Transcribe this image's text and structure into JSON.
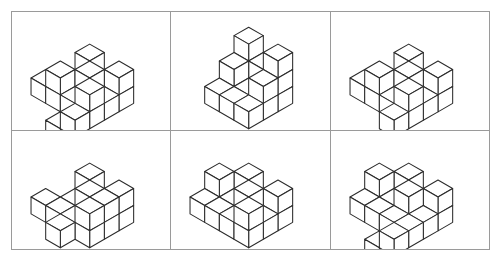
{
  "page": {
    "background_color": "#ffffff",
    "line_color": "#2b2b2b",
    "grid_border_color": "#9a9a9a",
    "width": 500,
    "height": 262,
    "rows": 2,
    "columns": 3
  },
  "figures": [
    {
      "id": "figure-1",
      "position": "row-1-col-1",
      "label": "",
      "description": "Isometric assembly: large notched block with three detached small cubes at left, right and front",
      "cube_unit": 17,
      "origin": {
        "x": 78,
        "y": 66
      },
      "cubes": [
        {
          "x": 0,
          "y": 0,
          "z": 0
        },
        {
          "x": 1,
          "y": 0,
          "z": 0
        },
        {
          "x": 2,
          "y": 0,
          "z": 0
        },
        {
          "x": 0,
          "y": 1,
          "z": 0
        },
        {
          "x": 2,
          "y": 1,
          "z": 0
        },
        {
          "x": 0,
          "y": 2,
          "z": 0
        },
        {
          "x": 1,
          "y": 2,
          "z": 0
        },
        {
          "x": 2,
          "y": 2,
          "z": 0
        },
        {
          "x": 0,
          "y": 0,
          "z": 1
        },
        {
          "x": 2,
          "y": 0,
          "z": 1
        },
        {
          "x": 0,
          "y": 2,
          "z": 1
        },
        {
          "x": 2,
          "y": 2,
          "z": 1
        },
        {
          "x": 1,
          "y": 1,
          "z": 1
        }
      ],
      "detached_cubes": [
        {
          "x": -1,
          "y": 2,
          "z": 0
        },
        {
          "x": 2,
          "y": 3,
          "z": 0
        },
        {
          "x": 1,
          "y": 3,
          "z": -1
        }
      ]
    },
    {
      "id": "figure-2",
      "position": "row-1-col-2",
      "label": "",
      "description": "Solid rectangular block with stepped staircase on the front-right and a square notch on the top",
      "cube_unit": 17,
      "origin": {
        "x": 78,
        "y": 66
      },
      "cubes": [
        {
          "x": 0,
          "y": 0,
          "z": 0
        },
        {
          "x": 1,
          "y": 0,
          "z": 0
        },
        {
          "x": 2,
          "y": 0,
          "z": 0
        },
        {
          "x": 0,
          "y": 1,
          "z": 0
        },
        {
          "x": 1,
          "y": 1,
          "z": 0
        },
        {
          "x": 2,
          "y": 1,
          "z": 0
        },
        {
          "x": 0,
          "y": 2,
          "z": 0
        },
        {
          "x": 1,
          "y": 2,
          "z": 0
        },
        {
          "x": 2,
          "y": 2,
          "z": 0
        },
        {
          "x": 0,
          "y": 0,
          "z": 1
        },
        {
          "x": 1,
          "y": 0,
          "z": 1
        },
        {
          "x": 2,
          "y": 0,
          "z": 1
        },
        {
          "x": 0,
          "y": 1,
          "z": 1
        },
        {
          "x": 2,
          "y": 1,
          "z": 1
        },
        {
          "x": 0,
          "y": 0,
          "z": 2
        },
        {
          "x": 2,
          "y": 0,
          "z": 2
        }
      ],
      "detached_cubes": []
    },
    {
      "id": "figure-3",
      "position": "row-1-col-3",
      "label": "",
      "description": "Isometric notched block with two small cubes attached at lower left and lower right",
      "cube_unit": 17,
      "origin": {
        "x": 78,
        "y": 66
      },
      "cubes": [
        {
          "x": 0,
          "y": 0,
          "z": 0
        },
        {
          "x": 1,
          "y": 0,
          "z": 0
        },
        {
          "x": 2,
          "y": 0,
          "z": 0
        },
        {
          "x": 0,
          "y": 1,
          "z": 0
        },
        {
          "x": 1,
          "y": 1,
          "z": 0
        },
        {
          "x": 2,
          "y": 1,
          "z": 0
        },
        {
          "x": 0,
          "y": 2,
          "z": 0
        },
        {
          "x": 1,
          "y": 2,
          "z": 0
        },
        {
          "x": 2,
          "y": 2,
          "z": 0
        },
        {
          "x": 0,
          "y": 0,
          "z": 1
        },
        {
          "x": 2,
          "y": 0,
          "z": 1
        },
        {
          "x": 0,
          "y": 2,
          "z": 1
        },
        {
          "x": 2,
          "y": 2,
          "z": 1
        },
        {
          "x": 1,
          "y": 1,
          "z": 1
        }
      ],
      "detached_cubes": [
        {
          "x": -1,
          "y": 2,
          "z": 0
        },
        {
          "x": 2,
          "y": 3,
          "z": 0
        }
      ]
    },
    {
      "id": "figure-4",
      "position": "row-2-col-1",
      "label": "",
      "description": "Notched isometric block with one detached cube at left and one cube on the front lower step",
      "cube_unit": 17,
      "origin": {
        "x": 78,
        "y": 66
      },
      "cubes": [
        {
          "x": 0,
          "y": 0,
          "z": 0
        },
        {
          "x": 1,
          "y": 0,
          "z": 0
        },
        {
          "x": 2,
          "y": 0,
          "z": 0
        },
        {
          "x": 0,
          "y": 1,
          "z": 0
        },
        {
          "x": 1,
          "y": 1,
          "z": 0
        },
        {
          "x": 2,
          "y": 1,
          "z": 0
        },
        {
          "x": 0,
          "y": 2,
          "z": 0
        },
        {
          "x": 1,
          "y": 2,
          "z": 0
        },
        {
          "x": 2,
          "y": 2,
          "z": 0
        },
        {
          "x": 0,
          "y": 0,
          "z": 1
        },
        {
          "x": 2,
          "y": 0,
          "z": 1
        },
        {
          "x": 2,
          "y": 1,
          "z": 1
        },
        {
          "x": 2,
          "y": 2,
          "z": 1
        },
        {
          "x": 1,
          "y": 1,
          "z": 1
        }
      ],
      "detached_cubes": [
        {
          "x": -1,
          "y": 2,
          "z": 0
        },
        {
          "x": 1,
          "y": 3,
          "z": 0
        }
      ]
    },
    {
      "id": "figure-5",
      "position": "row-2-col-2",
      "label": "",
      "description": "Notched block with a cube protruding at upper left and a detached cube below it",
      "cube_unit": 17,
      "origin": {
        "x": 78,
        "y": 66
      },
      "cubes": [
        {
          "x": 0,
          "y": 0,
          "z": 0
        },
        {
          "x": 1,
          "y": 0,
          "z": 0
        },
        {
          "x": 2,
          "y": 0,
          "z": 0
        },
        {
          "x": 0,
          "y": 1,
          "z": 0
        },
        {
          "x": 1,
          "y": 1,
          "z": 0
        },
        {
          "x": 2,
          "y": 1,
          "z": 0
        },
        {
          "x": 0,
          "y": 2,
          "z": 0
        },
        {
          "x": 1,
          "y": 2,
          "z": 0
        },
        {
          "x": 2,
          "y": 2,
          "z": 0
        },
        {
          "x": 0,
          "y": 0,
          "z": 1
        },
        {
          "x": 2,
          "y": 0,
          "z": 1
        },
        {
          "x": 2,
          "y": 2,
          "z": 1
        },
        {
          "x": 1,
          "y": 1,
          "z": 1
        }
      ],
      "detached_cubes": [
        {
          "x": -1,
          "y": 1,
          "z": 1
        },
        {
          "x": -1,
          "y": 2,
          "z": 0
        }
      ]
    },
    {
      "id": "figure-6",
      "position": "row-2-col-3",
      "label": "",
      "description": "Most complex figure: open notched frame with several small cubes at left, right and front",
      "cube_unit": 17,
      "origin": {
        "x": 78,
        "y": 66
      },
      "cubes": [
        {
          "x": 0,
          "y": 0,
          "z": 0
        },
        {
          "x": 1,
          "y": 0,
          "z": 0
        },
        {
          "x": 2,
          "y": 0,
          "z": 0
        },
        {
          "x": 0,
          "y": 1,
          "z": 0
        },
        {
          "x": 2,
          "y": 1,
          "z": 0
        },
        {
          "x": 0,
          "y": 2,
          "z": 0
        },
        {
          "x": 1,
          "y": 2,
          "z": 0
        },
        {
          "x": 2,
          "y": 2,
          "z": 0
        },
        {
          "x": 0,
          "y": 0,
          "z": 1
        },
        {
          "x": 2,
          "y": 0,
          "z": 1
        },
        {
          "x": 1,
          "y": 1,
          "z": 1
        }
      ],
      "detached_cubes": [
        {
          "x": -1,
          "y": 1,
          "z": 1
        },
        {
          "x": -1,
          "y": 2,
          "z": 0
        },
        {
          "x": 2,
          "y": 3,
          "z": 0
        },
        {
          "x": 1,
          "y": 3,
          "z": -1
        }
      ]
    }
  ]
}
